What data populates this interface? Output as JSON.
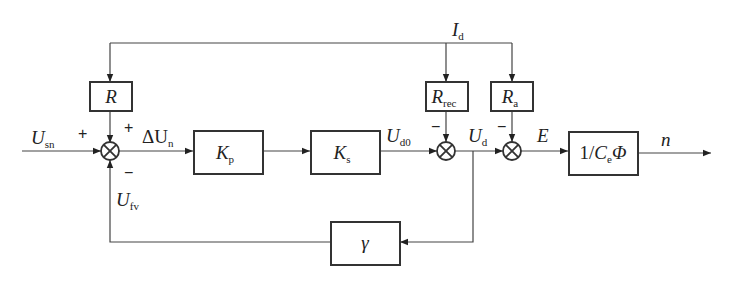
{
  "diagram": {
    "type": "control-block-diagram",
    "colors": {
      "line": "#444444",
      "block_border": "#333333",
      "background": "#ffffff"
    },
    "signals": {
      "input": {
        "main": "U",
        "sub": "sn"
      },
      "error": {
        "main": "ΔU",
        "sub": "n"
      },
      "feedback": {
        "main": "U",
        "sub": "fv"
      },
      "udo": {
        "main": "U",
        "sub": "d0"
      },
      "ud": {
        "main": "U",
        "sub": "d"
      },
      "current": {
        "main": "I",
        "sub": "d"
      },
      "emf": {
        "main": "E"
      },
      "output": {
        "main": "n"
      }
    },
    "blocks": {
      "r": {
        "main": "R"
      },
      "kp": {
        "main": "K",
        "sub": "p"
      },
      "ks": {
        "main": "K",
        "sub": "s"
      },
      "rrec": {
        "main": "R",
        "sub": "rec"
      },
      "ra": {
        "main": "R",
        "sub": "a"
      },
      "plant": {
        "pre": "1/",
        "main": "C",
        "sub": "e",
        "post": "Φ"
      },
      "gamma": {
        "main": "γ"
      }
    },
    "signs": {
      "sum1_left": "+",
      "sum1_top": "+",
      "sum1_bottom": "−",
      "sum2_top": "−",
      "sum3_top": "−"
    }
  }
}
